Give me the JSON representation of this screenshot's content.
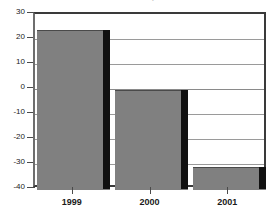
{
  "chart_data": {
    "type": "bar",
    "title": ")",
    "title_note": "title cropped off top of image; only faint parenthesis fragments visible",
    "xlabel": "",
    "ylabel": "",
    "categories": [
      "1999",
      "2000",
      "2001"
    ],
    "values": [
      23.5,
      -0.5,
      -31
    ],
    "series": [
      {
        "name": "",
        "values": [
          23.5,
          -0.5,
          -31
        ]
      }
    ],
    "ylim": [
      -40,
      30
    ],
    "ytick_labels": [
      "30",
      "20",
      "10",
      "0",
      "-10",
      "-20",
      "-30",
      "-40"
    ],
    "ytick_values": [
      30,
      20,
      10,
      0,
      -10,
      -20,
      -30,
      -40
    ],
    "grid": true,
    "legend": false,
    "bars_drawn_to_axis_floor": true,
    "colors": {
      "bar_face": "#808080",
      "bar_side": "#111111",
      "gridline": "#9a9a9a",
      "frame": "#3a3a3a",
      "text": "#1a1a1a",
      "background": "#ffffff"
    }
  }
}
